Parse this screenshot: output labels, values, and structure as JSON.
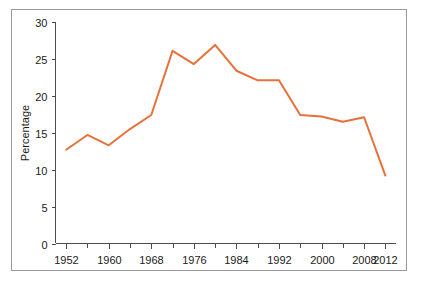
{
  "figure": {
    "frame_color": "#9a9a9a",
    "background": "#ffffff"
  },
  "chart_data": {
    "type": "line",
    "title": "",
    "subtitle": "",
    "xlabel": "",
    "ylabel": "Percentage",
    "xlim": [
      1950,
      2014
    ],
    "ylim": [
      0,
      30
    ],
    "grid": false,
    "legend": "none",
    "line_color": "#e8703a",
    "x": [
      1952,
      1956,
      1960,
      1964,
      1968,
      1972,
      1976,
      1980,
      1984,
      1988,
      1992,
      1996,
      2000,
      2004,
      2008,
      2012
    ],
    "values": [
      12.7,
      14.7,
      13.3,
      15.5,
      17.4,
      26.1,
      24.3,
      26.9,
      23.4,
      22.1,
      22.1,
      17.4,
      17.2,
      16.5,
      17.1,
      9.2
    ],
    "series": [
      {
        "name": "Percentage",
        "values": [
          12.7,
          14.7,
          13.3,
          15.5,
          17.4,
          26.1,
          24.3,
          26.9,
          23.4,
          22.1,
          22.1,
          17.4,
          17.2,
          16.5,
          17.1,
          9.2
        ]
      }
    ],
    "x_tick_labels": [
      "1952",
      "1960",
      "1968",
      "1976",
      "1984",
      "1992",
      "2000",
      "2008",
      "2012"
    ],
    "x_tick_values": [
      1952,
      1960,
      1968,
      1976,
      1984,
      1992,
      2000,
      2008,
      2012
    ],
    "x_minor_tick_values": [
      1956,
      1964,
      1972,
      1980,
      1988,
      1996,
      2004
    ],
    "y_tick_labels": [
      "0",
      "5",
      "10",
      "15",
      "20",
      "25",
      "30"
    ],
    "y_tick_values": [
      0,
      5,
      10,
      15,
      20,
      25,
      30
    ]
  }
}
